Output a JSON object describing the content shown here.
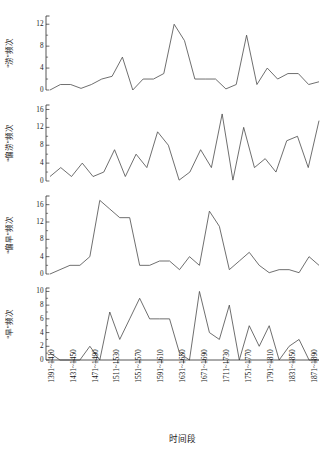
{
  "chart_data": {
    "type": "line",
    "title": "",
    "xlabel": "时间段",
    "grid": false,
    "legend": false,
    "x": [
      "1391~1410",
      "1411~1430",
      "1431~1450",
      "1451~1470",
      "1471~1490",
      "1491~1510",
      "1511~1530",
      "1531~1550",
      "1551~1570",
      "1571~1590",
      "1591~1610",
      "1611~1630",
      "1631~1650",
      "1651~1670",
      "1671~1690",
      "1691~1710",
      "1711~1730",
      "1731~1750",
      "1751~1770",
      "1771~1790",
      "1791~1810",
      "1811~1830",
      "1831~1850",
      "1851~1870",
      "1871~1890"
    ],
    "tick_labels": [
      "1391~1410",
      "1431~1450",
      "1471~1490",
      "1511~1530",
      "1551~1570",
      "1591~1610",
      "1631~1650",
      "1671~1690",
      "1711~1730",
      "1751~1770",
      "1791~1810",
      "1831~1850",
      "1871~1890"
    ],
    "panels": [
      {
        "ylabel": "“涝”频次",
        "ylim": [
          0,
          13.5
        ],
        "yticks": [
          0,
          4,
          8,
          12
        ],
        "yminor": [
          2,
          6,
          10
        ],
        "values": [
          0,
          1,
          1,
          0.3,
          1,
          2,
          2.5,
          6,
          0,
          2,
          2,
          3,
          12,
          9,
          2,
          2,
          2,
          0.2,
          1,
          10,
          1,
          4,
          2,
          3,
          3,
          1,
          1.5
        ]
      },
      {
        "ylabel": "“偏涝”频次",
        "ylim": [
          0,
          17
        ],
        "yticks": [
          0,
          4,
          8,
          12,
          16
        ],
        "yminor": [
          2,
          6,
          10,
          14
        ],
        "values": [
          1,
          3,
          1,
          4,
          1,
          2,
          7,
          1,
          6,
          3,
          11,
          8,
          0.2,
          2,
          7,
          3,
          15,
          0.2,
          12,
          3,
          5,
          2,
          9,
          10,
          3,
          13.5
        ]
      },
      {
        "ylabel": "“偏旱”频次",
        "ylim": [
          0,
          18
        ],
        "yticks": [
          0,
          4,
          8,
          12,
          16
        ],
        "yminor": [
          2,
          6,
          10,
          14
        ],
        "values": [
          0,
          1,
          2,
          2,
          4,
          17,
          15,
          13,
          13,
          2,
          2,
          3,
          3,
          1,
          4,
          2,
          14.5,
          11,
          1,
          3,
          5,
          2,
          0.3,
          1,
          1,
          0.3,
          4,
          2
        ]
      },
      {
        "ylabel": "“旱”频次",
        "ylim": [
          0,
          10.5
        ],
        "yticks": [
          0,
          2,
          4,
          6,
          8,
          10
        ],
        "yminor": [
          1,
          3,
          5,
          7,
          9
        ],
        "values": [
          1,
          0,
          0,
          0,
          2,
          0,
          7,
          3,
          6,
          9,
          6,
          6,
          6,
          1,
          0,
          10,
          4,
          3,
          8,
          0,
          5,
          2,
          5,
          0,
          2,
          3,
          0,
          0
        ]
      }
    ]
  },
  "axis_title": "时间段"
}
